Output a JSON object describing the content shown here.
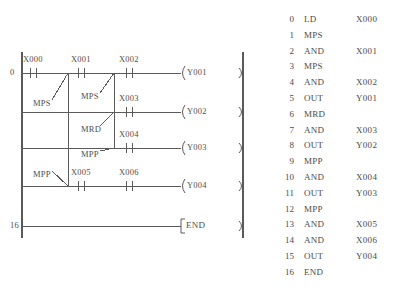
{
  "diagram": {
    "left_rail_step_labels": [
      {
        "step": "0",
        "y": 73
      },
      {
        "step": "16",
        "y": 226
      }
    ],
    "rungs": [
      {
        "name": "rung-y001",
        "y": 73,
        "contacts": [
          {
            "label": "X000",
            "x": 30
          },
          {
            "label": "X001",
            "x": 78
          },
          {
            "label": "X002",
            "x": 126
          }
        ],
        "coil": {
          "label": "Y001",
          "x": 183
        }
      },
      {
        "name": "rung-y002",
        "y": 112,
        "contacts": [
          {
            "label": "X003",
            "x": 126
          }
        ],
        "coil": {
          "label": "Y002",
          "x": 183
        }
      },
      {
        "name": "rung-y003",
        "y": 148,
        "contacts": [
          {
            "label": "X004",
            "x": 126
          }
        ],
        "coil": {
          "label": "Y003",
          "x": 183
        }
      },
      {
        "name": "rung-y004",
        "y": 186,
        "contacts": [
          {
            "label": "X005",
            "x": 78
          },
          {
            "label": "X006",
            "x": 126
          }
        ],
        "coil": {
          "label": "Y004",
          "x": 183
        }
      },
      {
        "name": "rung-end",
        "y": 226,
        "contacts": [],
        "coil": {
          "label": "END",
          "x": 183
        }
      }
    ],
    "stack_annotations": [
      {
        "label": "MPS",
        "name": "stack-annotation-mps-1",
        "text_x": 33,
        "text_y": 104,
        "leader_from_x": 52,
        "leader_from_y": 100,
        "leader_to_x": 68,
        "leader_to_y": 73
      },
      {
        "label": "MPS",
        "name": "stack-annotation-mps-2",
        "text_x": 81,
        "text_y": 97,
        "leader_from_x": 100,
        "leader_from_y": 93,
        "leader_to_x": 114,
        "leader_to_y": 73
      },
      {
        "label": "MRD",
        "name": "stack-annotation-mrd",
        "text_x": 81,
        "text_y": 130,
        "leader_from_x": 100,
        "leader_from_y": 126,
        "leader_to_x": 114,
        "leader_to_y": 112
      },
      {
        "label": "MPP",
        "name": "stack-annotation-mpp-1",
        "text_x": 81,
        "text_y": 155,
        "leader_from_x": 100,
        "leader_from_y": 151,
        "leader_to_x": 114,
        "leader_to_y": 148
      },
      {
        "label": "MPP",
        "name": "stack-annotation-mpp-2",
        "text_x": 33,
        "text_y": 175,
        "leader_from_x": 52,
        "leader_from_y": 171,
        "leader_to_x": 68,
        "leader_to_y": 186
      }
    ],
    "branch_lines": [
      {
        "name": "branch-rail-outer",
        "x": 68,
        "y1": 73,
        "y2": 186
      },
      {
        "name": "branch-rail-inner",
        "x": 114,
        "y1": 73,
        "y2": 148
      }
    ],
    "left_rail_x": 22,
    "right_rail_x": 243,
    "rail_top": 52,
    "rail_bottom": 238
  },
  "instruction_list": {
    "columns": [
      "step",
      "operation",
      "operand"
    ],
    "rows": [
      {
        "step": "0",
        "op": "LD",
        "arg": "X000"
      },
      {
        "step": "1",
        "op": "MPS",
        "arg": ""
      },
      {
        "step": "2",
        "op": "AND",
        "arg": "X001"
      },
      {
        "step": "3",
        "op": "MPS",
        "arg": ""
      },
      {
        "step": "4",
        "op": "AND",
        "arg": "X002"
      },
      {
        "step": "5",
        "op": "OUT",
        "arg": "Y001"
      },
      {
        "step": "6",
        "op": "MRD",
        "arg": ""
      },
      {
        "step": "7",
        "op": "AND",
        "arg": "X003"
      },
      {
        "step": "8",
        "op": "OUT",
        "arg": "Y002"
      },
      {
        "step": "9",
        "op": "MPP",
        "arg": ""
      },
      {
        "step": "10",
        "op": "AND",
        "arg": "X004"
      },
      {
        "step": "11",
        "op": "OUT",
        "arg": "Y003"
      },
      {
        "step": "12",
        "op": "MPP",
        "arg": ""
      },
      {
        "step": "13",
        "op": "AND",
        "arg": "X005"
      },
      {
        "step": "14",
        "op": "AND",
        "arg": "X006"
      },
      {
        "step": "15",
        "op": "OUT",
        "arg": "Y004"
      },
      {
        "step": "16",
        "op": "END",
        "arg": ""
      }
    ],
    "first_row_y": 14,
    "row_height": 15.8
  },
  "style": {
    "line_color": "#5a5a5a",
    "text_color": "#4a4a4a",
    "background": "#ffffff"
  }
}
